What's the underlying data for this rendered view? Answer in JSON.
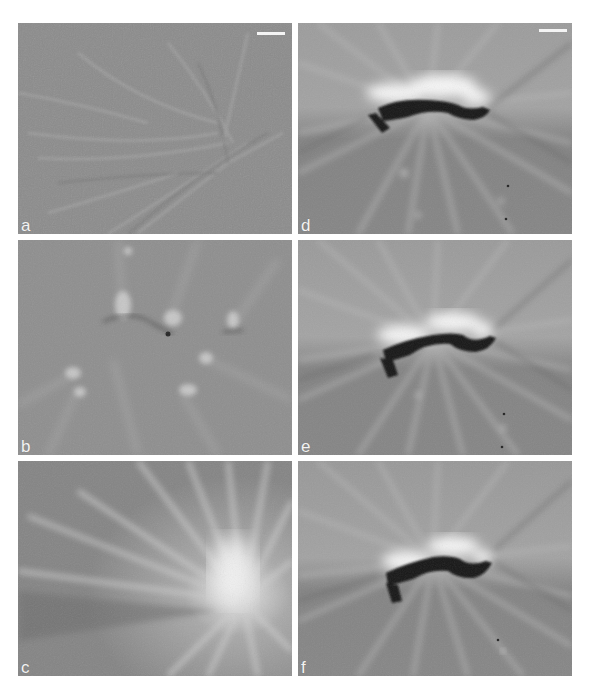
{
  "figure": {
    "background": "#ffffff",
    "panels": [
      {
        "id": "a",
        "label": "a",
        "x": 18,
        "y": 23,
        "w": 274,
        "h": 211,
        "has_scale_bar": true,
        "scale_bar": {
          "x": 239,
          "y": 10,
          "w": 28
        },
        "content": "fine diagonal fibrous streaks on uniform gray background"
      },
      {
        "id": "b",
        "label": "b",
        "x": 18,
        "y": 240,
        "w": 274,
        "h": 215,
        "has_scale_bar": false,
        "content": "several small dark foci with radiating bright streaks"
      },
      {
        "id": "c",
        "label": "c",
        "x": 18,
        "y": 461,
        "w": 274,
        "h": 215,
        "has_scale_bar": false,
        "content": "bright radial burst centered lower right"
      },
      {
        "id": "d",
        "label": "d",
        "x": 298,
        "y": 23,
        "w": 274,
        "h": 211,
        "has_scale_bar": true,
        "scale_bar": {
          "x": 241,
          "y": 7,
          "w": 28
        },
        "content": "dark curved object with bright halo above and radiating streaks"
      },
      {
        "id": "e",
        "label": "e",
        "x": 298,
        "y": 240,
        "w": 274,
        "h": 215,
        "has_scale_bar": false,
        "content": "dark curved object with bright halo above and radiating streaks"
      },
      {
        "id": "f",
        "label": "f",
        "x": 298,
        "y": 461,
        "w": 274,
        "h": 215,
        "has_scale_bar": false,
        "content": "dark curved object with bright halo above and radiating streaks"
      }
    ],
    "colors": {
      "panel_gray": "#8a8a8a",
      "label_text": "#f2f2f2",
      "scale_bar": "#f4f4f4",
      "dark_object": "#151515",
      "halo": "#f5f5f5"
    }
  }
}
